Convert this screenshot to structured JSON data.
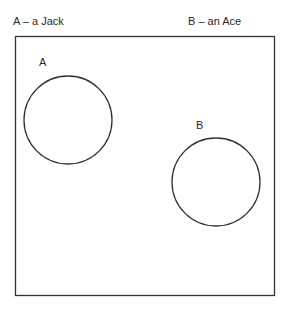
{
  "diagram": {
    "type": "venn",
    "caption_a": "A – a Jack",
    "caption_b": "B – an Ace",
    "universe": {
      "x": 15,
      "y": 36,
      "width": 259,
      "height": 259,
      "stroke": "#333333"
    },
    "sets": [
      {
        "id": "A",
        "label": "A",
        "cx": 68,
        "cy": 120,
        "r": 44
      },
      {
        "id": "B",
        "label": "B",
        "cx": 216,
        "cy": 182,
        "r": 44
      }
    ],
    "overlap": false
  }
}
